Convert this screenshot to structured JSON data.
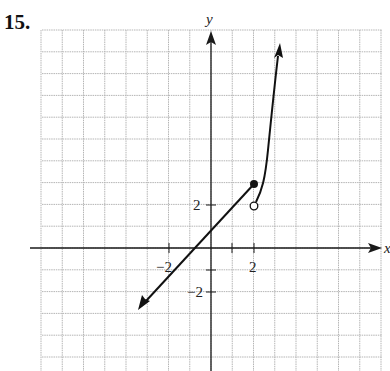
{
  "problem": {
    "number": "15."
  },
  "graph": {
    "x_axis_label": "x",
    "y_axis_label": "y",
    "tick_labels": {
      "x_neg": "−2",
      "x_pos": "2",
      "y_pos": "2",
      "y_neg": "−2"
    },
    "grid": {
      "x_min": -8,
      "x_max": 8,
      "y_min": -5.6,
      "y_max": 10,
      "step": 1
    },
    "colors": {
      "grid": "#b5b5b5",
      "axis": "#1a1a1a",
      "curve": "#111111"
    }
  },
  "chart_data": {
    "type": "line",
    "title": "",
    "xlabel": "x",
    "ylabel": "y",
    "xlim": [
      -8,
      8
    ],
    "ylim": [
      -5.6,
      10
    ],
    "grid": true,
    "tick_labels": {
      "x": [
        "-2",
        "2"
      ],
      "y": [
        "-2",
        "2"
      ]
    },
    "series": [
      {
        "name": "left piece: y = x + 1 (x <= 2)",
        "x": [
          -3.5,
          -1,
          0,
          2
        ],
        "y": [
          -2.5,
          0,
          1,
          3
        ],
        "left_end": "arrow",
        "right_end": "closed dot at (2, 3)"
      },
      {
        "name": "right piece: steep increasing curve (x > 2)",
        "x": [
          2,
          2.3,
          2.6,
          3.0,
          3.3
        ],
        "y": [
          2,
          3.2,
          5.5,
          8.5,
          9.6
        ],
        "left_end": "open circle at (2, 2)",
        "right_end": "arrow"
      }
    ],
    "annotations": [
      "closed dot at (2, 3)",
      "open circle at (2, 2)"
    ]
  }
}
